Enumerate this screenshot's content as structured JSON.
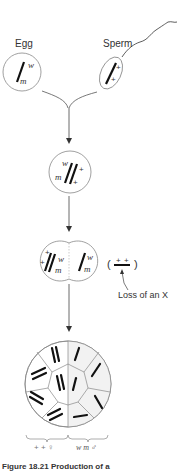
{
  "labels": {
    "egg": "Egg",
    "sperm": "Sperm",
    "loss": "Loss of an X",
    "left_paren": "(",
    "right_paren": ")"
  },
  "egg": {
    "alleles": [
      "w",
      "m"
    ]
  },
  "sperm": {
    "alleles": [
      "+",
      "+"
    ]
  },
  "zygote": {
    "alleles_left": [
      "w",
      "m"
    ],
    "alleles_right": [
      "+",
      "+"
    ]
  },
  "two_cell": {
    "left": {
      "alleles_left": [
        "+",
        "+"
      ],
      "alleles_right": [
        "w",
        "m"
      ]
    },
    "right": {
      "alleles": [
        "w",
        "m"
      ]
    },
    "lost_chromosome": [
      "+",
      "+"
    ]
  },
  "mosaic": {
    "left_label": "+ + ♀",
    "right_label": "w m ♂"
  },
  "caption": "Figure 18.21 Production of a"
}
